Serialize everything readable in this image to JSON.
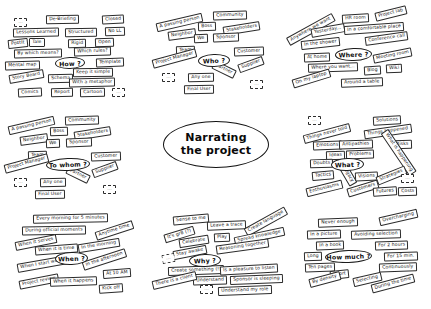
{
  "page": {
    "title": "Narrating the project",
    "background_color": "#ffffff",
    "ink_color": "#151515"
  },
  "center": {
    "line1": "Narrating",
    "line2": "the project"
  },
  "clusters": [
    {
      "id": "how",
      "question": "How ?",
      "notes": [
        {
          "text": "...",
          "x": 12,
          "y": 14,
          "rot": 0,
          "blank": true
        },
        {
          "text": "De-Briefing",
          "x": 44,
          "y": 11,
          "rot": -1
        },
        {
          "text": "Closed",
          "x": 100,
          "y": 11,
          "rot": -3
        },
        {
          "text": "Lessons Learned",
          "x": 11,
          "y": 24,
          "rot": -1
        },
        {
          "text": "Structured",
          "x": 63,
          "y": 24,
          "rot": -1
        },
        {
          "text": "No LL",
          "x": 103,
          "y": 23,
          "rot": -2
        },
        {
          "text": "PostIt",
          "x": 6,
          "y": 35,
          "rot": -6
        },
        {
          "text": "Tale",
          "x": 27,
          "y": 34,
          "rot": 0
        },
        {
          "text": "Rigid",
          "x": 66,
          "y": 35,
          "rot": -1
        },
        {
          "text": "Open",
          "x": 93,
          "y": 34,
          "rot": -2
        },
        {
          "text": "By which means?",
          "x": 12,
          "y": 45,
          "rot": -1
        },
        {
          "text": "Which rules?",
          "x": 72,
          "y": 43,
          "rot": -2
        },
        {
          "text": "Mental map",
          "x": 3,
          "y": 57,
          "rot": -2
        },
        {
          "text": "Template",
          "x": 94,
          "y": 54,
          "rot": -2
        },
        {
          "text": "Keep it simple",
          "x": 71,
          "y": 64,
          "rot": -1
        },
        {
          "text": "Schema",
          "x": 46,
          "y": 70,
          "rot": -1
        },
        {
          "text": "Story Board",
          "x": 7,
          "y": 68,
          "rot": -10
        },
        {
          "text": "With a metaphor",
          "x": 67,
          "y": 74,
          "rot": -1
        },
        {
          "text": "Comics",
          "x": 16,
          "y": 84,
          "rot": -3
        },
        {
          "text": "Report",
          "x": 49,
          "y": 84,
          "rot": -1
        },
        {
          "text": "Cartoon",
          "x": 78,
          "y": 84,
          "rot": -1
        },
        {
          "text": "...",
          "x": 110,
          "y": 84,
          "rot": 0,
          "blank": true
        }
      ],
      "oval": {
        "x": 53,
        "y": 53,
        "w": 30,
        "h": 12,
        "rot": -2
      }
    },
    {
      "id": "who",
      "question": "Who ?",
      "notes": [
        {
          "text": "A passing person",
          "x": 6,
          "y": 16,
          "rot": -13
        },
        {
          "text": "Community",
          "x": 63,
          "y": 9,
          "rot": -2
        },
        {
          "text": "Boss",
          "x": 48,
          "y": 20,
          "rot": -2
        },
        {
          "text": "Stakeholders",
          "x": 73,
          "y": 22,
          "rot": -9
        },
        {
          "text": "Neighbor",
          "x": 18,
          "y": 28,
          "rot": -8
        },
        {
          "text": "We",
          "x": 44,
          "y": 32,
          "rot": -2
        },
        {
          "text": "Sponsor",
          "x": 63,
          "y": 31,
          "rot": -2
        },
        {
          "text": "Team",
          "x": 26,
          "y": 44,
          "rot": -2
        },
        {
          "text": "Customer",
          "x": 84,
          "y": 45,
          "rot": -2
        },
        {
          "text": "Project Manager",
          "x": 2,
          "y": 52,
          "rot": -15
        },
        {
          "text": "Partner",
          "x": 62,
          "y": 63,
          "rot": 26
        },
        {
          "text": "Supplier",
          "x": 88,
          "y": 58,
          "rot": -20
        },
        {
          "text": "...",
          "x": 12,
          "y": 71,
          "rot": 0,
          "blank": true
        },
        {
          "text": "Any one",
          "x": 38,
          "y": 71,
          "rot": -1
        },
        {
          "text": "Final User",
          "x": 34,
          "y": 83,
          "rot": -1
        },
        {
          "text": "...",
          "x": 100,
          "y": 78,
          "rot": 0,
          "blank": true
        }
      ],
      "oval": {
        "x": 48,
        "y": 52,
        "w": 32,
        "h": 13,
        "rot": -2
      }
    },
    {
      "id": "where",
      "question": "Where ?",
      "notes": [
        {
          "text": "HR room",
          "x": 59,
          "y": 12,
          "rot": -3
        },
        {
          "text": "Project lab",
          "x": 92,
          "y": 7,
          "rot": -14
        },
        {
          "text": "Anywhere we want",
          "x": 2,
          "y": 23,
          "rot": -29
        },
        {
          "text": "Yesterday...",
          "x": 28,
          "y": 24,
          "rot": -10
        },
        {
          "text": "In a comfortable place",
          "x": 61,
          "y": 22,
          "rot": -4
        },
        {
          "text": "In the shower",
          "x": 18,
          "y": 37,
          "rot": -6
        },
        {
          "text": "Conference call",
          "x": 82,
          "y": 32,
          "rot": -8
        },
        {
          "text": "At home",
          "x": 21,
          "y": 51,
          "rot": -2
        },
        {
          "text": "Meeting room",
          "x": 90,
          "y": 49,
          "rot": -11
        },
        {
          "text": "Where you want...",
          "x": 25,
          "y": 61,
          "rot": -2
        },
        {
          "text": "Blog",
          "x": 81,
          "y": 64,
          "rot": -3
        },
        {
          "text": "Wiki",
          "x": 103,
          "y": 62,
          "rot": -3
        },
        {
          "text": "On my laptop",
          "x": 9,
          "y": 72,
          "rot": -17
        },
        {
          "text": "Around a table",
          "x": 58,
          "y": 76,
          "rot": -2
        }
      ],
      "oval": {
        "x": 52,
        "y": 46,
        "w": 37,
        "h": 13,
        "rot": -2
      }
    },
    {
      "id": "to-whom",
      "question": "To whom ?",
      "notes": [
        {
          "text": "A passing person",
          "x": 6,
          "y": 13,
          "rot": -13
        },
        {
          "text": "Community",
          "x": 63,
          "y": 8,
          "rot": -2
        },
        {
          "text": "Boss",
          "x": 48,
          "y": 19,
          "rot": -2
        },
        {
          "text": "Stakeholders",
          "x": 72,
          "y": 21,
          "rot": -9
        },
        {
          "text": "Neighbor",
          "x": 18,
          "y": 27,
          "rot": -8
        },
        {
          "text": "We",
          "x": 44,
          "y": 31,
          "rot": -2
        },
        {
          "text": "Sponsor",
          "x": 64,
          "y": 30,
          "rot": -2
        },
        {
          "text": "Team",
          "x": 26,
          "y": 43,
          "rot": -2
        },
        {
          "text": "Customer",
          "x": 89,
          "y": 44,
          "rot": -2
        },
        {
          "text": "Project Manager",
          "x": 2,
          "y": 51,
          "rot": -15
        },
        {
          "text": "Partner",
          "x": 64,
          "y": 62,
          "rot": 26
        },
        {
          "text": "Supplier",
          "x": 90,
          "y": 57,
          "rot": -20
        },
        {
          "text": "...",
          "x": 12,
          "y": 70,
          "rot": 0,
          "blank": true
        },
        {
          "text": "Any one",
          "x": 38,
          "y": 70,
          "rot": -1
        },
        {
          "text": "Final User",
          "x": 33,
          "y": 82,
          "rot": -1
        },
        {
          "text": "...",
          "x": 101,
          "y": 77,
          "rot": 0,
          "blank": true
        }
      ],
      "oval": {
        "x": 44,
        "y": 50,
        "w": 44,
        "h": 13,
        "rot": -2
      }
    },
    {
      "id": "what",
      "question": "What ?",
      "notes": [
        {
          "text": "...",
          "x": 27,
          "y": 8,
          "rot": 0,
          "blank": true
        },
        {
          "text": "Solutions",
          "x": 92,
          "y": 8,
          "rot": -3
        },
        {
          "text": "Things never told",
          "x": 22,
          "y": 21,
          "rot": -15
        },
        {
          "text": "Things happened",
          "x": 83,
          "y": 19,
          "rot": -8
        },
        {
          "text": "Emotions",
          "x": 32,
          "y": 33,
          "rot": -2
        },
        {
          "text": "Antipathies",
          "x": 58,
          "y": 32,
          "rot": -2
        },
        {
          "text": "Risks",
          "x": 112,
          "y": 32,
          "rot": -2
        },
        {
          "text": "Ideas",
          "x": 45,
          "y": 43,
          "rot": -2
        },
        {
          "text": "Problems",
          "x": 65,
          "y": 42,
          "rot": -2
        },
        {
          "text": "What is happening",
          "x": 92,
          "y": 40,
          "rot": 56
        },
        {
          "text": "Doubts",
          "x": 29,
          "y": 51,
          "rot": -2
        },
        {
          "text": "Tactics",
          "x": 31,
          "y": 63,
          "rot": -5
        },
        {
          "text": "Legacy",
          "x": 55,
          "y": 62,
          "rot": 60
        },
        {
          "text": "Visions",
          "x": 74,
          "y": 64,
          "rot": -3
        },
        {
          "text": "Strategies",
          "x": 95,
          "y": 63,
          "rot": -22
        },
        {
          "text": "...",
          "x": 120,
          "y": 66,
          "rot": 0,
          "blank": true
        },
        {
          "text": "Enthusiasms",
          "x": 25,
          "y": 76,
          "rot": -14
        },
        {
          "text": "Customers",
          "x": 66,
          "y": 76,
          "rot": -17
        },
        {
          "text": "Futures",
          "x": 92,
          "y": 79,
          "rot": -4
        },
        {
          "text": "Costs",
          "x": 117,
          "y": 79,
          "rot": -2
        }
      ],
      "oval": {
        "x": 50,
        "y": 50,
        "w": 33,
        "h": 13,
        "rot": -2
      }
    },
    {
      "id": "when",
      "question": "When ?",
      "notes": [
        {
          "text": "Every morning for 5 minutes",
          "x": 31,
          "y": 10,
          "rot": -1
        },
        {
          "text": "During official moments",
          "x": 20,
          "y": 22,
          "rot": -1
        },
        {
          "text": "Anytime time",
          "x": 93,
          "y": 22,
          "rot": -18
        },
        {
          "text": "When it serves",
          "x": 13,
          "y": 34,
          "rot": -11
        },
        {
          "text": "When it is time",
          "x": 33,
          "y": 41,
          "rot": -4
        },
        {
          "text": "In the morning",
          "x": 76,
          "y": 37,
          "rot": -9
        },
        {
          "text": "When I start working",
          "x": 15,
          "y": 55,
          "rot": -10
        },
        {
          "text": "In the afternoon",
          "x": 80,
          "y": 51,
          "rot": -18
        },
        {
          "text": "At 10 AM",
          "x": 101,
          "y": 65,
          "rot": -4
        },
        {
          "text": "Project review",
          "x": 17,
          "y": 73,
          "rot": -11
        },
        {
          "text": "When it happens",
          "x": 48,
          "y": 73,
          "rot": -2
        },
        {
          "text": "Kick off",
          "x": 97,
          "y": 80,
          "rot": -4
        }
      ],
      "oval": {
        "x": 53,
        "y": 48,
        "w": 33,
        "h": 13,
        "rot": -2
      }
    },
    {
      "id": "why",
      "question": "Why ?",
      "notes": [
        {
          "text": "Sense to me",
          "x": 27,
          "y": 11,
          "rot": -5
        },
        {
          "text": "Leave a trace",
          "x": 61,
          "y": 17,
          "rot": -2
        },
        {
          "text": "Create language",
          "x": 97,
          "y": 13,
          "rot": -29
        },
        {
          "text": "It's gr8 (?)",
          "x": 18,
          "y": 26,
          "rot": -17
        },
        {
          "text": "Play",
          "x": 68,
          "y": 29,
          "rot": -3
        },
        {
          "text": "Spread knowledge",
          "x": 88,
          "y": 28,
          "rot": -12
        },
        {
          "text": "Celebrate",
          "x": 33,
          "y": 33,
          "rot": -9
        },
        {
          "text": "Reasoning together",
          "x": 70,
          "y": 38,
          "rot": -8
        },
        {
          "text": "Stay awake",
          "x": 27,
          "y": 44,
          "rot": -11
        },
        {
          "text": "...",
          "x": 16,
          "y": 50,
          "rot": -10,
          "blank": true
        },
        {
          "text": "Create something (!)",
          "x": 22,
          "y": 62,
          "rot": -2
        },
        {
          "text": "Is a pleasure to listen",
          "x": 74,
          "y": 61,
          "rot": -3
        },
        {
          "text": "Understand",
          "x": 47,
          "y": 72,
          "rot": -2
        },
        {
          "text": "Sponsor is sleeping",
          "x": 84,
          "y": 71,
          "rot": -2
        },
        {
          "text": "There is a client",
          "x": 6,
          "y": 72,
          "rot": -13
        },
        {
          "text": "...",
          "x": 54,
          "y": 81,
          "rot": 0,
          "blank": true
        },
        {
          "text": "Understand my role",
          "x": 72,
          "y": 82,
          "rot": -2
        }
      ],
      "oval": {
        "x": 43,
        "y": 50,
        "w": 32,
        "h": 13,
        "rot": -2
      }
    },
    {
      "id": "how-much",
      "question": "How much ?",
      "notes": [
        {
          "text": "Never enough",
          "x": 31,
          "y": 18,
          "rot": -2
        },
        {
          "text": "Overcharging",
          "x": 92,
          "y": 13,
          "rot": -13
        },
        {
          "text": "In a picture",
          "x": 20,
          "y": 30,
          "rot": -2
        },
        {
          "text": "Avoiding selection",
          "x": 64,
          "y": 30,
          "rot": -2
        },
        {
          "text": "In a book",
          "x": 29,
          "y": 41,
          "rot": -2
        },
        {
          "text": "For 2 hours",
          "x": 88,
          "y": 41,
          "rot": -2
        },
        {
          "text": "Long",
          "x": 17,
          "y": 52,
          "rot": -2
        },
        {
          "text": "For 15 min.",
          "x": 97,
          "y": 52,
          "rot": -2
        },
        {
          "text": "Ten pages",
          "x": 18,
          "y": 63,
          "rot": -2
        },
        {
          "text": "Continuously",
          "x": 92,
          "y": 63,
          "rot": -2
        },
        {
          "text": "Short",
          "x": 43,
          "y": 70,
          "rot": -6
        },
        {
          "text": "By density",
          "x": 22,
          "y": 75,
          "rot": -15
        },
        {
          "text": "Selecting",
          "x": 66,
          "y": 75,
          "rot": -13
        },
        {
          "text": "During the time",
          "x": 84,
          "y": 79,
          "rot": -15
        }
      ],
      "oval": {
        "x": 38,
        "y": 50,
        "w": 47,
        "h": 13,
        "rot": -2
      }
    }
  ],
  "cluster_positions": {
    "how": {
      "x": 2,
      "y": 4
    },
    "who": {
      "x": 150,
      "y": 2
    },
    "where": {
      "x": 283,
      "y": 2
    },
    "to-whom": {
      "x": 2,
      "y": 108
    },
    "what": {
      "x": 281,
      "y": 108
    },
    "when": {
      "x": 2,
      "y": 204
    },
    "why": {
      "x": 146,
      "y": 204
    },
    "how-much": {
      "x": 287,
      "y": 200
    }
  }
}
